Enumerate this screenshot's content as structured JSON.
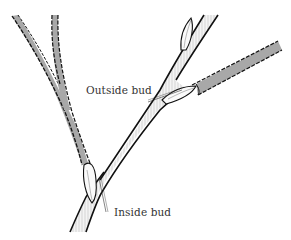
{
  "figure": {
    "labels": {
      "outside_bud": "Outside bud",
      "inside_bud": "Inside bud"
    },
    "elements": [
      {
        "name": "main-stem",
        "description": "light hatched stem running from bottom-left to top-right"
      },
      {
        "name": "left-branch",
        "description": "gray forked branch growing up-left from inside bud"
      },
      {
        "name": "right-branch",
        "description": "gray branch growing up-right from outside bud"
      },
      {
        "name": "top-bud",
        "description": "bud near top of main stem"
      },
      {
        "name": "outside-bud",
        "description": "bud facing outward, with pointer line"
      },
      {
        "name": "inside-bud",
        "description": "bud facing inward, with pointer line"
      }
    ],
    "colors": {
      "stem_fill": "#f2f2f2",
      "branch_fill": "#a8a8a8",
      "outline": "#111111",
      "text": "#333333",
      "background": "#ffffff"
    }
  }
}
